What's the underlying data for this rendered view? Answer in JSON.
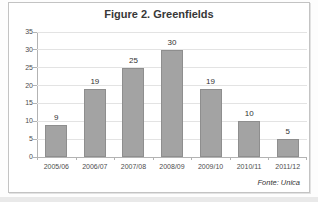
{
  "figure": {
    "source_note": "Fonte: Unica"
  },
  "chart_data": {
    "type": "bar",
    "title": "Figure 2. Greenfields",
    "categories": [
      "2005/06",
      "2006/07",
      "2007/08",
      "2008/09",
      "2009/10",
      "2010/11",
      "2011/12"
    ],
    "values": [
      9,
      19,
      25,
      30,
      19,
      10,
      5
    ],
    "xlabel": "",
    "ylabel": "",
    "ylim": [
      0,
      35
    ],
    "ytick_step": 5,
    "grid": true,
    "legend": "none",
    "data_labels": true,
    "bar_color": "#a3a3a3",
    "bar_border_color": "#8e8e8e",
    "source": "Fonte: Unica"
  }
}
